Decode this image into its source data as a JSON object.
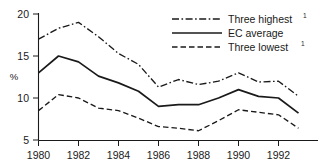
{
  "chart_data": {
    "type": "line",
    "title": "",
    "xlabel": "",
    "ylabel": "%",
    "x": [
      1980,
      1981,
      1982,
      1983,
      1984,
      1985,
      1986,
      1987,
      1988,
      1989,
      1990,
      1991,
      1992,
      1993
    ],
    "xlim": [
      1980,
      1993
    ],
    "ylim": [
      5,
      20
    ],
    "grid": false,
    "legend_position": "top-right",
    "x_ticks": [
      "1980",
      "1982",
      "1984",
      "1986",
      "1988",
      "1990",
      "1992"
    ],
    "x_tick_values": [
      1980,
      1982,
      1984,
      1986,
      1988,
      1990,
      1992
    ],
    "y_ticks": [
      "5",
      "10",
      "15",
      "20"
    ],
    "y_tick_values": [
      5,
      10,
      15,
      20
    ],
    "series": [
      {
        "name": "Three highest",
        "footnote": "1",
        "style": "dash-dot",
        "color": "#1a1a1a",
        "values": [
          17.0,
          18.3,
          19.0,
          17.3,
          15.3,
          14.0,
          11.3,
          12.2,
          11.6,
          12.0,
          13.0,
          11.9,
          12.0,
          10.2
        ]
      },
      {
        "name": "EC average",
        "footnote": "",
        "style": "solid",
        "color": "#1a1a1a",
        "values": [
          13.0,
          15.0,
          14.3,
          12.6,
          11.8,
          10.8,
          9.0,
          9.2,
          9.2,
          10.0,
          11.0,
          10.2,
          10.0,
          8.2
        ]
      },
      {
        "name": "Three lowest",
        "footnote": "1",
        "style": "dashed",
        "color": "#1a1a1a",
        "values": [
          8.5,
          10.4,
          10.0,
          8.8,
          8.5,
          7.6,
          6.6,
          6.4,
          6.1,
          7.3,
          8.6,
          8.3,
          8.0,
          6.4
        ]
      }
    ]
  },
  "legend": {
    "items": [
      {
        "label": "Three highest",
        "sup": "1"
      },
      {
        "label": "EC average",
        "sup": ""
      },
      {
        "label": "Three lowest",
        "sup": "1"
      }
    ]
  },
  "axes": {
    "y_axis_title": "%",
    "y_tick_labels": [
      "20",
      "15",
      "10",
      "5"
    ],
    "x_tick_labels": [
      "1980",
      "1982",
      "1984",
      "1986",
      "1988",
      "1990",
      "1992"
    ]
  }
}
